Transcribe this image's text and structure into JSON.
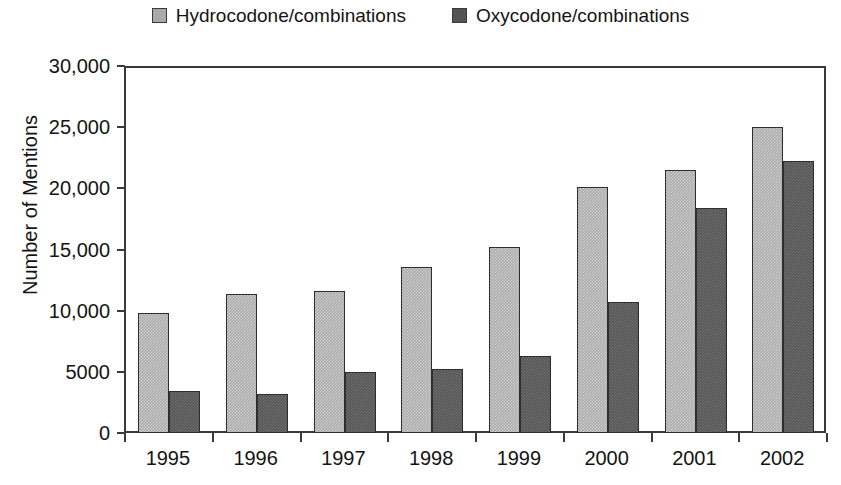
{
  "chart_data": {
    "type": "bar",
    "title": "",
    "subtitle": "",
    "xlabel": "",
    "ylabel": "Number of Mentions",
    "categories": [
      "1995",
      "1996",
      "1997",
      "1998",
      "1999",
      "2000",
      "2001",
      "2002"
    ],
    "series": [
      {
        "name": "Hydrocodone/combinations",
        "color": "#a9a9a9",
        "values": [
          9800,
          11400,
          11600,
          13600,
          15200,
          20100,
          21500,
          25000
        ]
      },
      {
        "name": "Oxycodone/combinations",
        "color": "#545454",
        "values": [
          3400,
          3200,
          5000,
          5200,
          6300,
          10700,
          18400,
          22200
        ]
      }
    ],
    "ylim": [
      0,
      30000
    ],
    "ytick_values": [
      0,
      5000,
      10000,
      15000,
      20000,
      25000,
      30000
    ],
    "ytick_labels": [
      "0",
      "5000",
      "10,000",
      "15,000",
      "20,000",
      "25,000",
      "30,000"
    ],
    "grid": false,
    "legend_position": "top-center",
    "axis_color": "#3a3a3a"
  },
  "legend": {
    "items": [
      {
        "label": "Hydrocodone/combinations",
        "swatch": "legend-swatch-light"
      },
      {
        "label": "Oxycodone/combinations",
        "swatch": "legend-swatch-dark"
      }
    ]
  }
}
